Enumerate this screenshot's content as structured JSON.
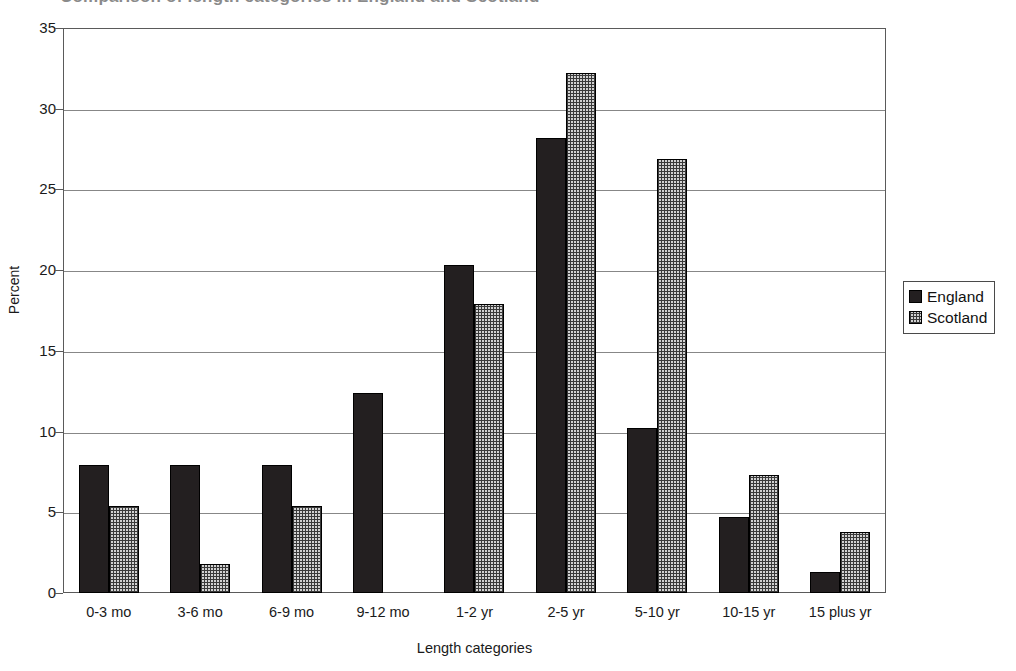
{
  "chart_data": {
    "type": "bar",
    "title": "Comparison of length categories in England and Scotland",
    "xlabel": "Length categories",
    "ylabel": "Percent",
    "ylim": [
      0,
      35
    ],
    "ytick_step": 5,
    "yticks": [
      35,
      30,
      25,
      20,
      15,
      10,
      5,
      0
    ],
    "grid": true,
    "legend_position": "right",
    "categories": [
      "0-3 mo",
      "3-6 mo",
      "6-9 mo",
      "9-12 mo",
      "1-2 yr",
      "2-5 yr",
      "5-10 yr",
      "10-15 yr",
      "15 plus yr"
    ],
    "series": [
      {
        "name": "England",
        "color": "#231f20",
        "fill": "solid",
        "values": [
          7.9,
          7.9,
          7.9,
          12.4,
          20.3,
          28.2,
          10.2,
          4.7,
          1.3
        ]
      },
      {
        "name": "Scotland",
        "color": "#d2d2d2",
        "fill": "stippled",
        "values": [
          5.4,
          1.8,
          5.4,
          null,
          17.9,
          32.2,
          26.9,
          7.3,
          3.8
        ]
      }
    ]
  },
  "legend": {
    "entries": [
      {
        "label": "England"
      },
      {
        "label": "Scotland"
      }
    ]
  }
}
